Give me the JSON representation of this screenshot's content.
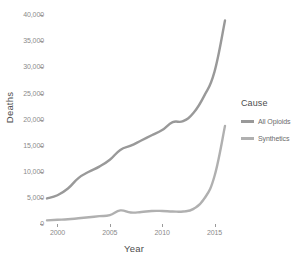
{
  "chart_data": {
    "type": "line",
    "title": "",
    "xlabel": "Year",
    "ylabel": "Deaths",
    "xlim": [
      1999,
      2016
    ],
    "ylim": [
      0,
      41000
    ],
    "xticks": [
      2000,
      2005,
      2010,
      2015
    ],
    "xtick_labels": [
      "2000",
      "2005",
      "2010",
      "2015"
    ],
    "yticks": [
      0,
      5000,
      10000,
      15000,
      20000,
      25000,
      30000,
      35000,
      40000
    ],
    "ytick_labels": [
      "0",
      "5,000",
      "10,000",
      "15,000",
      "20,000",
      "25,000",
      "30,000",
      "35,000",
      "40,000"
    ],
    "grid": false,
    "legend_position": "right",
    "legend_title": "Cause",
    "x": [
      1999,
      2000,
      2001,
      2002,
      2003,
      2004,
      2005,
      2006,
      2007,
      2008,
      2009,
      2010,
      2011,
      2012,
      2013,
      2014,
      2015,
      2016
    ],
    "series": [
      {
        "name": "All Opioids",
        "color": "#999999",
        "values": [
          4900,
          5500,
          6800,
          8800,
          10000,
          11000,
          12300,
          14200,
          15000,
          16000,
          17000,
          18000,
          19500,
          19700,
          21300,
          24500,
          29200,
          39000
        ]
      },
      {
        "name": "Synthetics",
        "color": "#b0b0b0",
        "values": [
          700,
          800,
          900,
          1100,
          1300,
          1500,
          1700,
          2600,
          2200,
          2300,
          2500,
          2500,
          2400,
          2400,
          2900,
          4800,
          9200,
          18800
        ]
      }
    ]
  },
  "axes": {
    "y_title": "Deaths",
    "x_title": "Year"
  },
  "legend": {
    "title": "Cause",
    "items": [
      {
        "label": "All Opioids",
        "color": "#999999"
      },
      {
        "label": "Synthetics",
        "color": "#b0b0b0"
      }
    ]
  }
}
